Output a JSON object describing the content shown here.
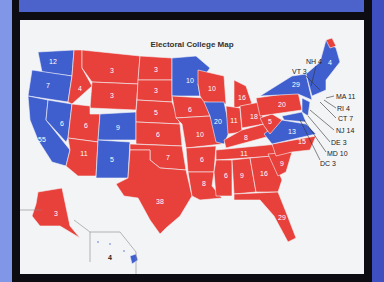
{
  "title": "Electoral College Map",
  "colors": {
    "republican": "#e8403a",
    "democrat": "#3f5fcf",
    "card": "#f3f4f6",
    "frame": "#0c0c12",
    "background": "#4a5fc8"
  },
  "states_inline": {
    "WA": "12",
    "OR": "7",
    "CA": "55",
    "NV": "6",
    "ID": "4",
    "MT": "3",
    "WY": "3",
    "UT": "6",
    "CO": "9",
    "AZ": "11",
    "NM": "5",
    "ND": "3",
    "SD": "3",
    "NE": "5",
    "KS": "6",
    "OK": "7",
    "TX": "38",
    "MN": "10",
    "IA": "6",
    "MO": "10",
    "AR": "6",
    "LA": "8",
    "WI": "10",
    "IL": "20",
    "MI": "16",
    "IN": "11",
    "OH": "18",
    "KY": "8",
    "TN": "11",
    "MS": "6",
    "AL": "9",
    "GA": "16",
    "FL": "29",
    "SC": "9",
    "NC": "15",
    "VA": "13",
    "WV": "5",
    "PA": "20",
    "NY": "29",
    "ME": "4",
    "AK": "3",
    "HI": "4"
  },
  "callouts": [
    "NH 4",
    "VT 3",
    "MA 11",
    "RI 4",
    "CT 7",
    "NJ 14",
    "DE 3",
    "MD 10",
    "DC 3"
  ]
}
